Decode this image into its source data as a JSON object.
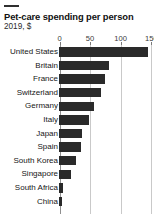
{
  "header": {
    "title": "Pet-care spending per person",
    "subtitle": "2019, $"
  },
  "chart_data": {
    "type": "bar",
    "orientation": "horizontal",
    "title": "Pet-care spending per person",
    "subtitle": "2019, $",
    "xlabel": "",
    "ylabel": "",
    "xlim": [
      0,
      160
    ],
    "ticks": [
      0,
      50,
      100,
      150
    ],
    "tick_labels": [
      "0",
      "50",
      "100",
      "150"
    ],
    "grid": true,
    "legend": false,
    "bar_color": "#2a2a2a",
    "gridline_color": "#c9c9c9",
    "categories": [
      "United States",
      "Britain",
      "France",
      "Switzerland",
      "Germany",
      "Italy",
      "Japan",
      "Spain",
      "South Korea",
      "Singapore",
      "South Africa",
      "China"
    ],
    "values": [
      146,
      82,
      75,
      68,
      57,
      49,
      37,
      36,
      28,
      19,
      6,
      5
    ]
  }
}
